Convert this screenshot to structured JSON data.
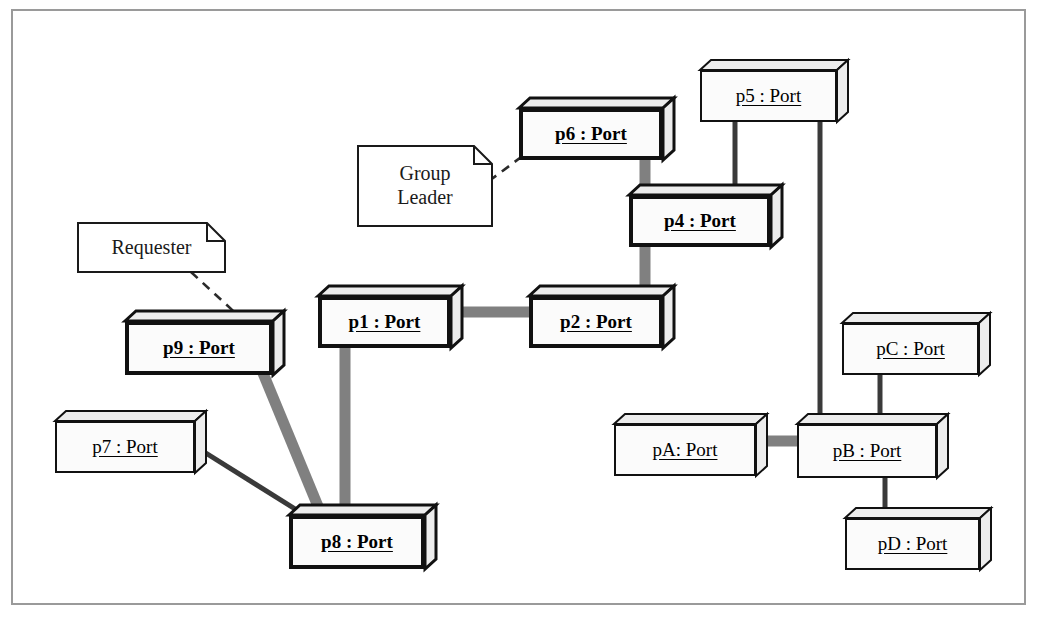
{
  "diagram": {
    "background": "#ffffff",
    "frame_color": "#9a9a9a",
    "node_fill": "#fbfbfb",
    "node_top_fill": "#ededed",
    "node_stroke": "#111111",
    "edge_thick_color": "#808080",
    "edge_thin_color": "#3a3a3a",
    "note_link_color": "#2b2b2b"
  },
  "nodes": [
    {
      "id": "p6",
      "label": "p6 : Port",
      "x": 519,
      "y": 98,
      "w": 144,
      "h": 52,
      "emphasis": "thick"
    },
    {
      "id": "p5",
      "label": "p5 : Port",
      "x": 700,
      "y": 60,
      "w": 137,
      "h": 52,
      "emphasis": "thin"
    },
    {
      "id": "p4",
      "label": "p4 : Port",
      "x": 629,
      "y": 185,
      "w": 142,
      "h": 52,
      "emphasis": "thick"
    },
    {
      "id": "p1",
      "label": "p1 : Port",
      "x": 318,
      "y": 286,
      "w": 133,
      "h": 52,
      "emphasis": "thick"
    },
    {
      "id": "p2",
      "label": "p2 : Port",
      "x": 529,
      "y": 286,
      "w": 134,
      "h": 52,
      "emphasis": "thick"
    },
    {
      "id": "p9",
      "label": "p9 : Port",
      "x": 125,
      "y": 311,
      "w": 148,
      "h": 54,
      "emphasis": "thick"
    },
    {
      "id": "pC",
      "label": "pC : Port",
      "x": 842,
      "y": 313,
      "w": 137,
      "h": 52,
      "emphasis": "thin"
    },
    {
      "id": "p7",
      "label": "p7 : Port",
      "x": 55,
      "y": 411,
      "w": 140,
      "h": 52,
      "emphasis": "thin"
    },
    {
      "id": "pA",
      "label": "pA: Port",
      "x": 614,
      "y": 414,
      "w": 142,
      "h": 52,
      "emphasis": "thin"
    },
    {
      "id": "pB",
      "label": "pB : Port",
      "x": 797,
      "y": 414,
      "w": 140,
      "h": 54,
      "emphasis": "thin"
    },
    {
      "id": "p8",
      "label": "p8 : Port",
      "x": 289,
      "y": 505,
      "w": 136,
      "h": 54,
      "emphasis": "thick"
    },
    {
      "id": "pD",
      "label": "pD : Port",
      "x": 845,
      "y": 508,
      "w": 135,
      "h": 52,
      "emphasis": "thin"
    }
  ],
  "edges": [
    {
      "from": "p6",
      "to": "p4",
      "x1": 645,
      "y1": 150,
      "x2": 645,
      "y2": 196,
      "weight": "thick"
    },
    {
      "from": "p5",
      "to": "p4",
      "x1": 735,
      "y1": 112,
      "x2": 735,
      "y2": 196,
      "weight": "thin"
    },
    {
      "from": "p5",
      "to": "pB",
      "x1": 820,
      "y1": 112,
      "x2": 820,
      "y2": 424,
      "weight": "thin"
    },
    {
      "from": "p4",
      "to": "p2",
      "x1": 645,
      "y1": 237,
      "x2": 645,
      "y2": 297,
      "weight": "thick"
    },
    {
      "from": "p1",
      "to": "p2",
      "x1": 443,
      "y1": 312,
      "x2": 540,
      "y2": 312,
      "weight": "thick"
    },
    {
      "from": "p1",
      "to": "p8",
      "x1": 345,
      "y1": 338,
      "x2": 345,
      "y2": 515,
      "weight": "thick"
    },
    {
      "from": "p9",
      "to": "p8",
      "x1": 258,
      "y1": 361,
      "x2": 322,
      "y2": 516,
      "weight": "thick"
    },
    {
      "from": "p7",
      "to": "p8",
      "x1": 185,
      "y1": 440,
      "x2": 300,
      "y2": 512,
      "weight": "thin"
    },
    {
      "from": "pA",
      "to": "pB",
      "x1": 748,
      "y1": 441,
      "x2": 808,
      "y2": 441,
      "weight": "thick"
    },
    {
      "from": "pC",
      "to": "pB",
      "x1": 880,
      "y1": 365,
      "x2": 880,
      "y2": 424,
      "weight": "thin"
    },
    {
      "from": "pB",
      "to": "pD",
      "x1": 885,
      "y1": 468,
      "x2": 885,
      "y2": 518,
      "weight": "thin"
    }
  ],
  "notes": [
    {
      "id": "group-leader",
      "lines": [
        "Group",
        "Leader"
      ],
      "x": 357,
      "y": 145,
      "w": 136,
      "h": 82,
      "link": {
        "x1": 489,
        "y1": 181,
        "x2": 528,
        "y2": 152
      }
    },
    {
      "id": "requester",
      "lines": [
        "Requester"
      ],
      "x": 77,
      "y": 222,
      "w": 149,
      "h": 51,
      "link": {
        "x1": 191,
        "y1": 272,
        "x2": 243,
        "y2": 320
      }
    }
  ]
}
